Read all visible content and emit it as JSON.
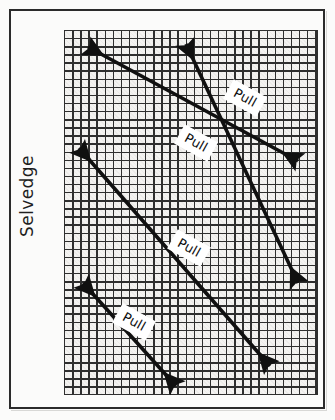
{
  "figure": {
    "kind": "fabric-bias-stretch-diagram",
    "background_color": "#fbfbfa",
    "frame": {
      "border_color": "#2b2b2b",
      "border_width_px": 2
    }
  },
  "labels": {
    "selvedge": "Selvedge"
  },
  "grid": {
    "name": "fabric-grain-grid",
    "line_color": "#2f2f2f",
    "fill_color": "#f4f3f1",
    "cell_size_px": 8,
    "columns": 31,
    "rows": 45,
    "left_px": 64,
    "top_px": 30,
    "width_px": 254,
    "height_px": 365
  },
  "arrows": [
    {
      "id": "arrow-1",
      "label": "Pull",
      "color": "#101010",
      "double_headed": true,
      "x1": 88,
      "y1": 47,
      "x2": 298,
      "y2": 161,
      "label_x": 245,
      "label_y": 98,
      "label_rotation_deg": 29
    },
    {
      "id": "arrow-2",
      "label": "Pull",
      "color": "#101010",
      "double_headed": true,
      "x1": 186,
      "y1": 44,
      "x2": 298,
      "y2": 283,
      "label_x": 196,
      "label_y": 143,
      "label_rotation_deg": 29
    },
    {
      "id": "arrow-3",
      "label": "Pull",
      "color": "#101010",
      "double_headed": true,
      "x1": 79,
      "y1": 148,
      "x2": 270,
      "y2": 366,
      "label_x": 189,
      "label_y": 248,
      "label_rotation_deg": 29
    },
    {
      "id": "arrow-4",
      "label": "Pull",
      "color": "#101010",
      "double_headed": true,
      "x1": 83,
      "y1": 283,
      "x2": 176,
      "y2": 386,
      "label_x": 134,
      "label_y": 322,
      "label_rotation_deg": 29
    }
  ]
}
